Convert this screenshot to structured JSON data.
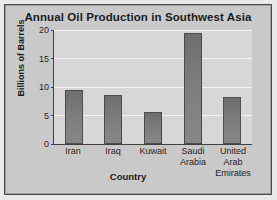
{
  "chart_data": {
    "type": "bar",
    "title": "Annual Oil Production in Southwest Asia",
    "xlabel": "Country",
    "ylabel": "Billions of Barrels",
    "categories": [
      "Iran",
      "Iraq",
      "Kuwait",
      "Saudi Arabia",
      "United Arab Emirates"
    ],
    "category_lines": [
      [
        "Iran"
      ],
      [
        "Iraq"
      ],
      [
        "Kuwait"
      ],
      [
        "Saudi",
        "Arabia"
      ],
      [
        "United",
        "Arab",
        "Emirates"
      ]
    ],
    "values": [
      9.5,
      8.6,
      5.6,
      19.5,
      8.3
    ],
    "ylim": [
      0,
      20
    ],
    "yticks": [
      0,
      5,
      10,
      15,
      20
    ],
    "ytick_labels": [
      "0",
      "5",
      "10",
      "15",
      "20"
    ],
    "grid": true,
    "legend": "none",
    "colors": {
      "bar_fill": "#7c7c7c",
      "bar_edge": "#4c4c4c",
      "plot_background": "#d7d7d7",
      "figure_background": "#c9c9c9",
      "frame_border": "#4a4a4a",
      "gridline": "#f2f2f2",
      "axis_line": "#3f3f3f",
      "text": "#1c1c1c"
    }
  }
}
